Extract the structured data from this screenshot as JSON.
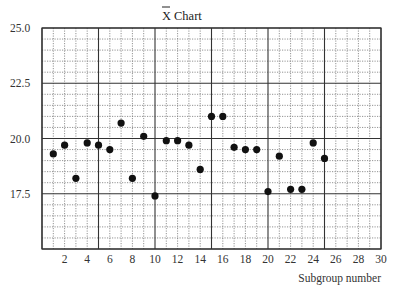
{
  "chart_data": {
    "type": "scatter",
    "title_main": "X",
    "title_suffix": "Chart",
    "xlabel": "Subgroup number",
    "ylabel": "",
    "xlim": [
      0,
      30
    ],
    "ylim": [
      15,
      25
    ],
    "xticks": [
      2,
      4,
      6,
      8,
      10,
      12,
      14,
      16,
      18,
      20,
      22,
      24,
      26,
      28,
      30
    ],
    "yticks": [
      17.5,
      20.0,
      22.5,
      25.0
    ],
    "ytick_labels": [
      "17.5",
      "20.0",
      "22.5",
      "25.0"
    ],
    "grid": {
      "major_x_every": 5,
      "minor_x_every": 1,
      "major_y_every": 2.5,
      "minor_y_every": 0.5
    },
    "legend": null,
    "series": [
      {
        "name": "Subgroup means",
        "x": [
          1,
          2,
          3,
          4,
          5,
          6,
          7,
          8,
          9,
          10,
          11,
          12,
          13,
          14,
          15,
          16,
          17,
          18,
          19,
          20,
          21,
          22,
          23,
          24,
          25
        ],
        "values": [
          19.3,
          19.7,
          18.2,
          19.8,
          19.7,
          19.5,
          20.7,
          18.2,
          20.1,
          17.4,
          19.9,
          19.9,
          19.7,
          18.6,
          21.0,
          21.0,
          19.6,
          19.5,
          19.5,
          17.6,
          19.2,
          17.7,
          17.7,
          19.8,
          19.1
        ]
      }
    ]
  },
  "colors": {
    "points": "#111111",
    "major_grid": "#333333",
    "minor_grid": "#777777",
    "text": "#333333"
  }
}
